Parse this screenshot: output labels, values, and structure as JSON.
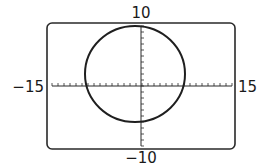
{
  "chart_data": {
    "type": "line",
    "title": "",
    "xlim": [
      -15,
      15
    ],
    "ylim": [
      -10,
      10
    ],
    "xlabel": "",
    "ylabel": "",
    "tick_labels": {
      "x_min": "−15",
      "x_max": "15",
      "y_min": "−10",
      "y_max": "10"
    },
    "x_ticks_step": 1,
    "y_ticks_step": 1,
    "grid": false,
    "series": [
      {
        "name": "circle",
        "shape": "circle",
        "center": [
          -0.5,
          1.5
        ],
        "radius_x": 8,
        "radius_y": 8,
        "approx_extent": {
          "x": [
            -8.5,
            7.5
          ],
          "y": [
            -6.5,
            9.5
          ]
        }
      }
    ]
  },
  "labels": {
    "top": "10",
    "bottom": "−10",
    "left": "−15",
    "right": "15"
  }
}
